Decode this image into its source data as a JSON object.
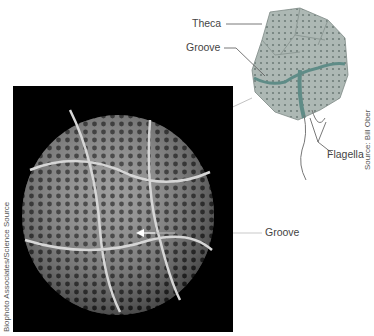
{
  "diagram": {
    "illustration": {
      "labels": {
        "theca": "Theca",
        "groove": "Groove",
        "flagella": "Flagella"
      },
      "credit": "Source: Bill Ober",
      "colors": {
        "fill": "#a9b5b0",
        "dots": "#6f7d79",
        "groove": "#5f8c87",
        "stroke": "#7d8985"
      }
    },
    "photo": {
      "labels": {
        "groove": "Groove"
      },
      "credit": "Biophoto Associates/Science Source",
      "colors": {
        "background": "#000000",
        "cell": "#9a9a9a"
      }
    }
  }
}
